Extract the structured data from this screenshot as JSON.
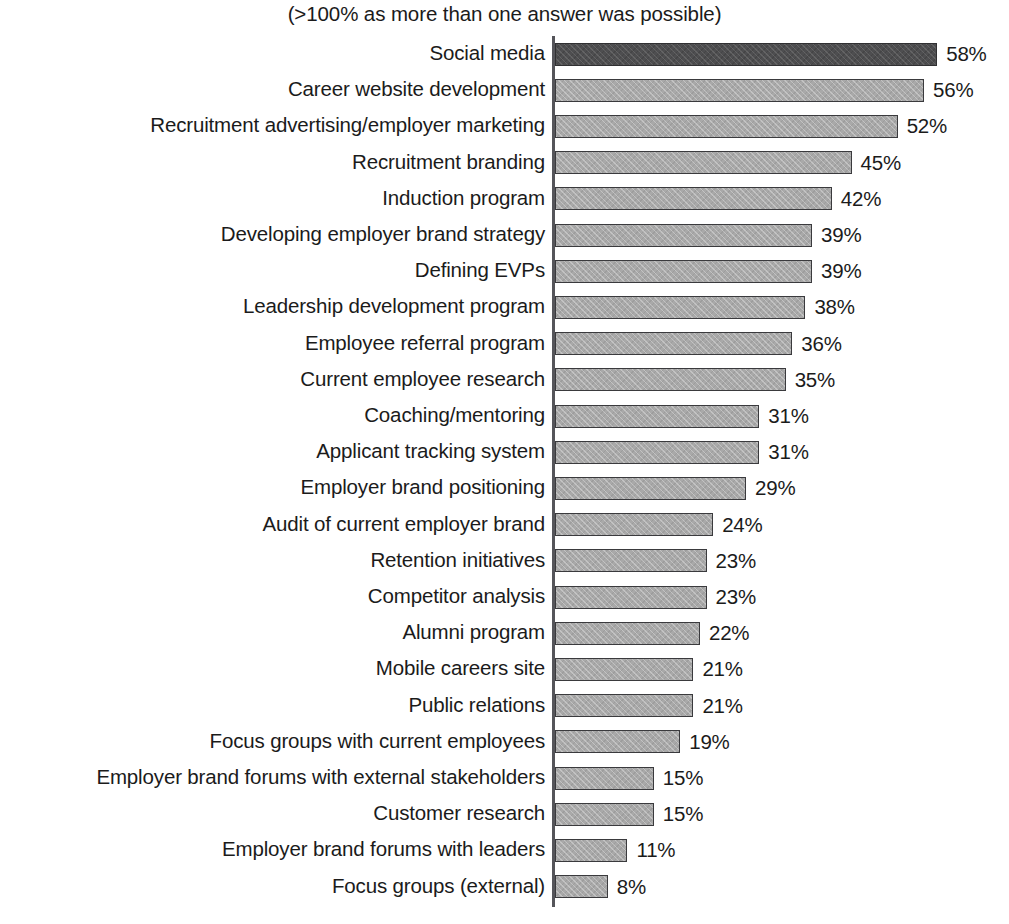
{
  "chart_data": {
    "type": "bar",
    "orientation": "horizontal",
    "title": "(>100% as more than one answer was possible)",
    "xlabel": "",
    "ylabel": "",
    "xlim": [
      0,
      58
    ],
    "grid": false,
    "legend": null,
    "value_suffix": "%",
    "highlight_index": 0,
    "colors": {
      "bar": "#a9a9a9",
      "bar_highlight": "#4e4e50",
      "bar_border": "#3a3a3d",
      "text": "#1b1b1b",
      "axis": "#55555a",
      "background": "#ffffff"
    },
    "categories": [
      "Social media",
      "Career website development",
      "Recruitment advertising/employer marketing",
      "Recruitment branding",
      "Induction program",
      "Developing employer brand strategy",
      "Defining EVPs",
      "Leadership development program",
      "Employee referral program",
      "Current employee research",
      "Coaching/mentoring",
      "Applicant tracking system",
      "Employer brand positioning",
      "Audit of current employer brand",
      "Retention initiatives",
      "Competitor analysis",
      "Alumni program",
      "Mobile careers site",
      "Public relations",
      "Focus groups with current employees",
      "Employer brand forums with external stakeholders",
      "Customer research",
      "Employer brand forums with leaders",
      "Focus groups (external)"
    ],
    "values": [
      58,
      56,
      52,
      45,
      42,
      39,
      39,
      38,
      36,
      35,
      31,
      31,
      29,
      24,
      23,
      23,
      22,
      21,
      21,
      19,
      15,
      15,
      11,
      8
    ],
    "value_labels": [
      "58%",
      "56%",
      "52%",
      "45%",
      "42%",
      "39%",
      "39%",
      "38%",
      "36%",
      "35%",
      "31%",
      "31%",
      "29%",
      "24%",
      "23%",
      "23%",
      "22%",
      "21%",
      "21%",
      "19%",
      "15%",
      "15%",
      "11%",
      "8%"
    ]
  }
}
